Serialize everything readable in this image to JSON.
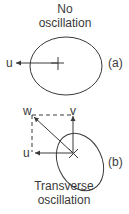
{
  "diagram": {
    "panel_a": {
      "title_line1": "No",
      "title_line2": "oscillation",
      "vector_label_u": "u",
      "panel_label": "(a)"
    },
    "panel_b": {
      "vector_label_w": "w",
      "vector_label_v": "v",
      "vector_label_u": "u",
      "panel_label": "(b)",
      "caption_line1": "Transverse",
      "caption_line2": "oscillation"
    },
    "colors": {
      "stroke": "#3a3a3a",
      "background": "#ffffff"
    }
  }
}
